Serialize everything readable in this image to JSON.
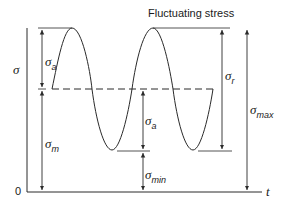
{
  "title": "Fluctuating stress",
  "axes": {
    "y_label": "σ",
    "x_label": "t",
    "origin_label": "0"
  },
  "labels": {
    "sigma_a_left": {
      "symbol": "σ",
      "sub": "a"
    },
    "sigma_m": {
      "symbol": "σ",
      "sub": "m"
    },
    "sigma_a_mid": {
      "symbol": "σ",
      "sub": "a"
    },
    "sigma_min": {
      "symbol": "σ",
      "sub": "min"
    },
    "sigma_r": {
      "symbol": "σ",
      "sub": "r"
    },
    "sigma_max": {
      "symbol": "σ",
      "sub": "max"
    }
  },
  "colors": {
    "line": "#2a2a2a",
    "background": "#ffffff"
  }
}
